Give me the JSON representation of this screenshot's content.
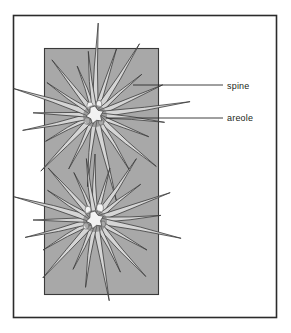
{
  "figure": {
    "background_color": "#ffffff",
    "frame": {
      "name": "outer-frame",
      "x": 13,
      "y": 15,
      "width": 264,
      "height": 303,
      "stroke_color": "#2b2b2b",
      "fill_color": "#ffffff"
    },
    "stem_panel": {
      "name": "cactus-stem-panel",
      "x": 44,
      "y": 48,
      "width": 115,
      "height": 247,
      "fill_color": "#a8a8a8",
      "stroke_color": "#3a3a3a"
    },
    "colors": {
      "spine_fill": "#d5d5d5",
      "spine_stroke": "#3b3b3b",
      "areole_fill": "#f2f2f2",
      "areole_shadow": "#6e6e6e",
      "leader_line": "#2b2b2b",
      "label_text": "#231f20"
    }
  },
  "labels": [
    {
      "id": "spine",
      "text": "spine",
      "text_x": 227,
      "text_y": 89,
      "leader_x1": 133,
      "leader_y1": 85,
      "leader_x2": 223,
      "leader_y2": 85
    },
    {
      "id": "areole",
      "text": "areole",
      "text_x": 227,
      "text_y": 121,
      "leader_x1": 106,
      "leader_y1": 118,
      "leader_x2": 223,
      "leader_y2": 118
    }
  ],
  "areoles": [
    {
      "id": "upper-areole",
      "cx": 95,
      "cy": 115,
      "radius": 9,
      "spines": [
        {
          "angle": -88,
          "length": 92,
          "halfwidth": 3.0
        },
        {
          "angle": -72,
          "length": 70,
          "halfwidth": 2.6
        },
        {
          "angle": -58,
          "length": 84,
          "halfwidth": 3.2
        },
        {
          "angle": -41,
          "length": 62,
          "halfwidth": 2.4
        },
        {
          "angle": -24,
          "length": 74,
          "halfwidth": 2.8
        },
        {
          "angle": -8,
          "length": 96,
          "halfwidth": 3.0
        },
        {
          "angle": 6,
          "length": 70,
          "halfwidth": 2.6
        },
        {
          "angle": 22,
          "length": 58,
          "halfwidth": 2.3
        },
        {
          "angle": 40,
          "length": 80,
          "halfwidth": 3.0
        },
        {
          "angle": 58,
          "length": 66,
          "halfwidth": 2.5
        },
        {
          "angle": 76,
          "length": 88,
          "halfwidth": 3.1
        },
        {
          "angle": 96,
          "length": 72,
          "halfwidth": 2.6
        },
        {
          "angle": 116,
          "length": 60,
          "halfwidth": 2.4
        },
        {
          "angle": 134,
          "length": 78,
          "halfwidth": 3.0
        },
        {
          "angle": 152,
          "length": 56,
          "halfwidth": 2.3
        },
        {
          "angle": 168,
          "length": 74,
          "halfwidth": 2.8
        },
        {
          "angle": 182,
          "length": 62,
          "halfwidth": 2.5
        },
        {
          "angle": 198,
          "length": 86,
          "halfwidth": 3.2
        },
        {
          "angle": 214,
          "length": 58,
          "halfwidth": 2.3
        },
        {
          "angle": 232,
          "length": 70,
          "halfwidth": 2.7
        },
        {
          "angle": 250,
          "length": 52,
          "halfwidth": 2.2
        },
        {
          "angle": 264,
          "length": 64,
          "halfwidth": 2.5
        }
      ]
    },
    {
      "id": "lower-areole",
      "cx": 95,
      "cy": 220,
      "radius": 9,
      "spines": [
        {
          "angle": -90,
          "length": 66,
          "halfwidth": 2.8
        },
        {
          "angle": -74,
          "length": 54,
          "halfwidth": 2.4
        },
        {
          "angle": -56,
          "length": 74,
          "halfwidth": 3.0
        },
        {
          "angle": -38,
          "length": 58,
          "halfwidth": 2.4
        },
        {
          "angle": -20,
          "length": 80,
          "halfwidth": 3.1
        },
        {
          "angle": -4,
          "length": 66,
          "halfwidth": 2.7
        },
        {
          "angle": 12,
          "length": 88,
          "halfwidth": 3.2
        },
        {
          "angle": 30,
          "length": 60,
          "halfwidth": 2.5
        },
        {
          "angle": 48,
          "length": 76,
          "halfwidth": 3.0
        },
        {
          "angle": 64,
          "length": 58,
          "halfwidth": 2.4
        },
        {
          "angle": 80,
          "length": 82,
          "halfwidth": 3.1
        },
        {
          "angle": 98,
          "length": 68,
          "halfwidth": 2.7
        },
        {
          "angle": 114,
          "length": 54,
          "halfwidth": 2.3
        },
        {
          "angle": 132,
          "length": 78,
          "halfwidth": 3.0
        },
        {
          "angle": 150,
          "length": 60,
          "halfwidth": 2.5
        },
        {
          "angle": 166,
          "length": 72,
          "halfwidth": 2.8
        },
        {
          "angle": 180,
          "length": 62,
          "halfwidth": 2.5
        },
        {
          "angle": 196,
          "length": 84,
          "halfwidth": 3.2
        },
        {
          "angle": 212,
          "length": 56,
          "halfwidth": 2.3
        },
        {
          "angle": 228,
          "length": 70,
          "halfwidth": 2.7
        },
        {
          "angle": 246,
          "length": 52,
          "halfwidth": 2.2
        },
        {
          "angle": 262,
          "length": 62,
          "halfwidth": 2.5
        }
      ]
    }
  ],
  "bristles": [
    {
      "cx": 90,
      "cy": 106,
      "rx": 3.2,
      "ry": 4.0
    },
    {
      "cx": 99,
      "cy": 104,
      "rx": 2.8,
      "ry": 3.6
    },
    {
      "cx": 87,
      "cy": 121,
      "rx": 3.0,
      "ry": 3.4
    },
    {
      "cx": 101,
      "cy": 122,
      "rx": 2.6,
      "ry": 3.2
    },
    {
      "cx": 88,
      "cy": 210,
      "rx": 3.0,
      "ry": 3.8
    },
    {
      "cx": 100,
      "cy": 208,
      "rx": 3.4,
      "ry": 4.2
    },
    {
      "cx": 86,
      "cy": 226,
      "rx": 2.8,
      "ry": 3.2
    },
    {
      "cx": 103,
      "cy": 224,
      "rx": 2.6,
      "ry": 3.0
    }
  ]
}
